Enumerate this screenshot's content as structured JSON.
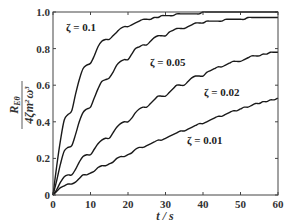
{
  "chart_data": {
    "type": "line",
    "title": "",
    "xlabel": "t / s",
    "ylabel": "R_{Eθ} / (4ζ m² ω³)",
    "xlim": [
      0,
      60
    ],
    "ylim": [
      0,
      1.0
    ],
    "xticks": [
      0,
      10,
      20,
      30,
      40,
      50,
      60
    ],
    "yticks": [
      0,
      0.2,
      0.4,
      0.6,
      0.8,
      1.0
    ],
    "xtick_labels": [
      "0",
      "10",
      "20",
      "30",
      "40",
      "50",
      "60"
    ],
    "ytick_labels": [
      "0",
      "0.2",
      "0.4",
      "0.6",
      "0.8",
      "1.0"
    ],
    "grid": false,
    "legend": "inline annotations",
    "x": [
      0,
      1,
      2,
      3,
      4,
      5,
      6,
      7,
      8,
      9,
      10,
      11,
      12,
      13,
      14,
      15,
      16,
      17,
      18,
      19,
      20,
      21,
      22,
      23,
      24,
      25,
      26,
      27,
      28,
      29,
      30,
      31,
      32,
      33,
      34,
      35,
      36,
      37,
      38,
      39,
      40,
      41,
      42,
      43,
      44,
      45,
      46,
      47,
      48,
      49,
      50,
      51,
      52,
      53,
      54,
      55,
      56,
      57,
      58,
      59,
      60
    ],
    "series": [
      {
        "name": "ζ = 0.1",
        "label_pos": [
          8,
          0.91
        ],
        "values": [
          0.0,
          0.16,
          0.3,
          0.41,
          0.44,
          0.46,
          0.55,
          0.63,
          0.69,
          0.71,
          0.72,
          0.76,
          0.81,
          0.84,
          0.85,
          0.85,
          0.87,
          0.89,
          0.91,
          0.92,
          0.92,
          0.93,
          0.94,
          0.95,
          0.96,
          0.96,
          0.96,
          0.97,
          0.97,
          0.98,
          0.98,
          0.98,
          0.98,
          0.99,
          0.99,
          0.99,
          0.99,
          0.99,
          0.99,
          0.99,
          1.0,
          1.0,
          1.0,
          1.0,
          1.0,
          1.0,
          1.0,
          1.0,
          1.0,
          1.0,
          1.0,
          1.0,
          1.0,
          1.0,
          1.0,
          1.0,
          1.0,
          1.0,
          1.0,
          1.0,
          1.0
        ]
      },
      {
        "name": "ζ = 0.05",
        "label_pos": [
          38,
          0.75
        ],
        "values": [
          0.0,
          0.08,
          0.17,
          0.24,
          0.26,
          0.27,
          0.33,
          0.4,
          0.45,
          0.47,
          0.48,
          0.53,
          0.58,
          0.62,
          0.63,
          0.64,
          0.67,
          0.71,
          0.73,
          0.74,
          0.74,
          0.77,
          0.8,
          0.81,
          0.82,
          0.82,
          0.84,
          0.86,
          0.87,
          0.87,
          0.87,
          0.89,
          0.9,
          0.91,
          0.91,
          0.91,
          0.92,
          0.93,
          0.94,
          0.94,
          0.94,
          0.95,
          0.95,
          0.95,
          0.95,
          0.95,
          0.96,
          0.96,
          0.96,
          0.96,
          0.96,
          0.96,
          0.97,
          0.97,
          0.97,
          0.97,
          0.97,
          0.97,
          0.97,
          0.97,
          0.97
        ]
      },
      {
        "name": "ζ = 0.02",
        "label_pos": [
          44,
          0.45
        ],
        "values": [
          0.0,
          0.03,
          0.07,
          0.1,
          0.11,
          0.11,
          0.14,
          0.18,
          0.21,
          0.22,
          0.22,
          0.25,
          0.28,
          0.3,
          0.31,
          0.31,
          0.34,
          0.37,
          0.39,
          0.4,
          0.4,
          0.42,
          0.45,
          0.47,
          0.48,
          0.48,
          0.5,
          0.52,
          0.54,
          0.54,
          0.54,
          0.56,
          0.58,
          0.6,
          0.6,
          0.6,
          0.62,
          0.64,
          0.65,
          0.65,
          0.65,
          0.67,
          0.68,
          0.69,
          0.7,
          0.7,
          0.71,
          0.72,
          0.73,
          0.73,
          0.73,
          0.74,
          0.75,
          0.76,
          0.76,
          0.76,
          0.77,
          0.77,
          0.78,
          0.78,
          0.78
        ]
      },
      {
        "name": "ζ = 0.01",
        "label_pos": [
          43,
          0.16
        ],
        "values": [
          0.0,
          0.02,
          0.04,
          0.05,
          0.06,
          0.06,
          0.07,
          0.09,
          0.11,
          0.11,
          0.12,
          0.13,
          0.15,
          0.16,
          0.16,
          0.17,
          0.18,
          0.2,
          0.21,
          0.21,
          0.22,
          0.23,
          0.25,
          0.26,
          0.26,
          0.27,
          0.28,
          0.29,
          0.3,
          0.3,
          0.31,
          0.32,
          0.33,
          0.34,
          0.35,
          0.35,
          0.36,
          0.37,
          0.38,
          0.39,
          0.39,
          0.4,
          0.41,
          0.42,
          0.43,
          0.43,
          0.44,
          0.45,
          0.46,
          0.46,
          0.47,
          0.48,
          0.48,
          0.49,
          0.5,
          0.5,
          0.51,
          0.51,
          0.52,
          0.52,
          0.53
        ]
      }
    ]
  },
  "labels": {
    "curve_0": "ζ = 0.1",
    "curve_1": "ζ = 0.05",
    "curve_2": "ζ = 0.02",
    "curve_3": "ζ = 0.01",
    "ylabel_num": "R",
    "ylabel_num_sub": "Eθ",
    "ylabel_den": "4ζm",
    "ylabel_den_tail": "ω",
    "xlabel": "t / s"
  }
}
